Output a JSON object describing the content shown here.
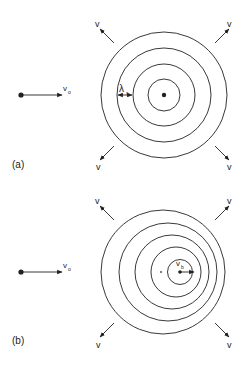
{
  "panels": [
    {
      "id": "a",
      "label": "(a)",
      "observer_velocity_label": "v",
      "observer_velocity_sub": "o",
      "wave_speed_label": "v",
      "wavelength_label": "λ",
      "wavelength_sub": "s",
      "source_moving": false,
      "wavefront_count": 4
    },
    {
      "id": "b",
      "label": "(b)",
      "observer_velocity_label": "v",
      "observer_velocity_sub": "o",
      "wave_speed_label": "v",
      "source_velocity_label": "v",
      "source_velocity_sub": "b",
      "source_moving": true,
      "wavefront_count": 5
    }
  ],
  "colors": {
    "stroke": "#222222",
    "background": "#ffffff"
  }
}
